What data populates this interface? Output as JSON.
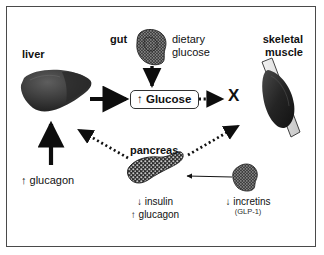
{
  "figure": {
    "type": "diagram",
    "title": "",
    "border_color": "#4a4a4a",
    "background": "#ffffff",
    "text_color": "#111111"
  },
  "nodes": {
    "liver": {
      "label": "liver",
      "organ": "liver-silhouette"
    },
    "gut": {
      "label": "gut",
      "organ": "gut-silhouette"
    },
    "dietary_glucose": {
      "line1": "dietary",
      "line2": "glucose"
    },
    "glucose_box": {
      "label": "↑ Glucose"
    },
    "skeletal_muscle": {
      "line1": "skeletal",
      "line2": "muscle",
      "organ": "muscle-spindle"
    },
    "block_marker": {
      "label": "X"
    },
    "pancreas": {
      "label": "pancreas",
      "organ": "pancreas-silhouette"
    },
    "incretin_source": {
      "organ": "gut-silhouette-small"
    }
  },
  "annotations": {
    "glucagon_liver": {
      "label": "↑ glucagon"
    },
    "pancreas_output_1": {
      "label": "↓ insulin"
    },
    "pancreas_output_2": {
      "label": "↑ glucagon"
    },
    "incretins": {
      "label": "↓ incretins",
      "sublabel": "(GLP-1)"
    }
  },
  "edges": [
    {
      "name": "liver-to-glucose",
      "style": "thick-solid",
      "from": "liver",
      "to": "glucose_box"
    },
    {
      "name": "gut-to-glucose",
      "style": "solid",
      "from": "gut",
      "to": "glucose_box"
    },
    {
      "name": "glucose-to-muscle-blocked",
      "style": "dotted",
      "from": "glucose_box",
      "to": "block_marker"
    },
    {
      "name": "glucagon-to-liver",
      "style": "thick-solid",
      "from": "glucagon_liver",
      "to": "liver"
    },
    {
      "name": "pancreas-to-liver",
      "style": "dotted",
      "from": "pancreas",
      "to": "liver"
    },
    {
      "name": "pancreas-to-muscle",
      "style": "dotted",
      "from": "pancreas",
      "to": "skeletal_muscle"
    },
    {
      "name": "incretins-to-pancreas",
      "style": "thin-solid",
      "from": "incretin_source",
      "to": "pancreas"
    }
  ]
}
